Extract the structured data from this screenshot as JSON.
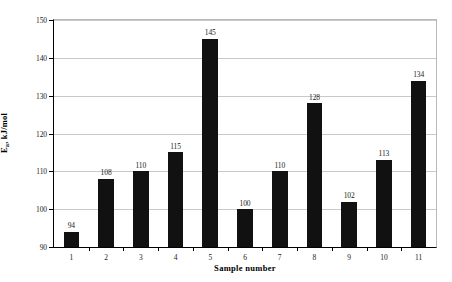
{
  "chart_data": {
    "type": "bar",
    "title": "",
    "xlabel": "Sample number",
    "ylabel": "Ea, kJ/mol",
    "ylabel_base": "E",
    "ylabel_sub": "a",
    "ylabel_rest": ", kJ/mol",
    "categories": [
      "1",
      "2",
      "3",
      "4",
      "5",
      "6",
      "7",
      "8",
      "9",
      "10",
      "11"
    ],
    "values": [
      94,
      108,
      110,
      115,
      145,
      100,
      110,
      128,
      102,
      113,
      134
    ],
    "ylim": [
      90,
      150
    ],
    "ytick_step": 10,
    "yticks": [
      "90",
      "100",
      "110",
      "120",
      "130",
      "140",
      "150"
    ],
    "grid": true,
    "legend": "none",
    "bar_color": "#111111",
    "grid_color": "#c9c9c9",
    "axis_color": "#000000",
    "background": "#ffffff"
  }
}
